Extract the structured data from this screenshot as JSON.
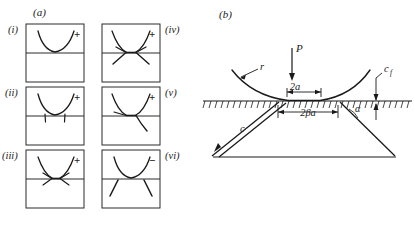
{
  "figure": {
    "caption_a": "(a)",
    "caption_b": "(b)"
  },
  "panel_a": {
    "label": "(a)",
    "description": "Six schematic sub-panels showing the sequential evolution of a Hertzian cone crack beneath a spherical indenter.",
    "subpanels": [
      {
        "id": "i",
        "label": "(i)",
        "sign": "+",
        "stage": "ring-crack-initiation",
        "side": "left",
        "row": 1
      },
      {
        "id": "ii",
        "label": "(ii)",
        "sign": "+",
        "stage": "surface-ring-downward-spikes",
        "side": "left",
        "row": 2
      },
      {
        "id": "iii",
        "label": "(iii)",
        "sign": "+",
        "stage": "flattened-contact-branching",
        "side": "left",
        "row": 3
      },
      {
        "id": "iv",
        "label": "(iv)",
        "sign": "+",
        "stage": "symmetric-cone-branches",
        "side": "right",
        "row": 1
      },
      {
        "id": "v",
        "label": "(v)",
        "sign": "+",
        "stage": "asymmetric-single-branch",
        "side": "right",
        "row": 2
      },
      {
        "id": "vi",
        "label": "(vi)",
        "sign": "−",
        "stage": "detached-downward-cracks",
        "side": "right",
        "row": 3
      }
    ]
  },
  "panel_b": {
    "label": "(b)",
    "description": "Cross-section of a sphere of radius r pressed by load P onto a flat hatched half-space, producing a cone crack.",
    "annotations": {
      "load": "P",
      "sphere_radius": "r",
      "contact_width": "2a",
      "ring_diameter": "2βa",
      "cone_crack_length": "c",
      "surface_flaw": "c",
      "surface_flaw_sub": "f",
      "cone_angle": "α"
    }
  },
  "style": {
    "ink": "#1a1a1a",
    "rule": "#2b2b2b",
    "background": "#ffffff",
    "stroke_main": 1.1,
    "stroke_thin": 0.8
  }
}
